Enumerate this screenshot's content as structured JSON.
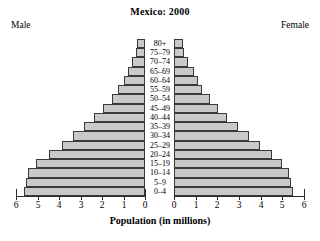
{
  "chart_data": {
    "type": "bar",
    "subtype": "population-pyramid",
    "title": "Mexico: 2000",
    "xlabel": "Population (in millions)",
    "ylabel": "",
    "grid": false,
    "legend_position": "top-corners",
    "left_side_label": "Male",
    "right_side_label": "Female",
    "xlim": [
      0,
      6
    ],
    "xticks": [
      0,
      1,
      2,
      3,
      4,
      5,
      6
    ],
    "left_tick_labels": [
      "6",
      "5",
      "4",
      "3",
      "2",
      "1",
      "0"
    ],
    "right_tick_labels": [
      "0",
      "1",
      "2",
      "3",
      "4",
      "5",
      "6"
    ],
    "categories": [
      "0–4",
      "5–9",
      "10–14",
      "15–19",
      "20–24",
      "25–29",
      "30–34",
      "35–39",
      "40–44",
      "45–49",
      "50–54",
      "55–59",
      "60–64",
      "65–69",
      "70–74",
      "75–79",
      "80+"
    ],
    "series": [
      {
        "name": "Male",
        "side": "left",
        "values": [
          5.65,
          5.55,
          5.45,
          5.05,
          4.45,
          3.85,
          3.35,
          2.85,
          2.35,
          1.95,
          1.55,
          1.25,
          1.0,
          0.8,
          0.6,
          0.4,
          0.35
        ]
      },
      {
        "name": "Female",
        "side": "right",
        "values": [
          5.5,
          5.4,
          5.3,
          5.0,
          4.5,
          3.95,
          3.45,
          2.95,
          2.45,
          2.05,
          1.65,
          1.3,
          1.1,
          0.9,
          0.65,
          0.45,
          0.4
        ]
      }
    ],
    "colors": {
      "bar_fill": "#c9c9c9",
      "bar_border": "#3a3a3a",
      "axis": "#2b2b2b",
      "text": "#000000",
      "background": "#ffffff"
    }
  }
}
